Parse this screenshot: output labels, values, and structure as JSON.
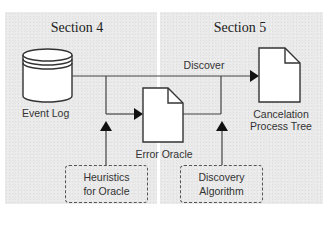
{
  "sections": [
    {
      "title": "Section 4"
    },
    {
      "title": "Section 5"
    }
  ],
  "nodes": {
    "event_log": {
      "label": "Event Log",
      "shape": "database-cylinder"
    },
    "error_oracle": {
      "label": "Error Oracle",
      "shape": "document"
    },
    "cancelation_tree": {
      "label_line1": "Cancelation",
      "label_line2": "Process Tree",
      "shape": "document"
    },
    "heuristics": {
      "label_line1": "Heuristics",
      "label_line2": "for Oracle",
      "shape": "dashed-box"
    },
    "discovery_algorithm": {
      "label_line1": "Discovery",
      "label_line2": "Algorithm",
      "shape": "dashed-box"
    }
  },
  "edges": [
    {
      "from": "Event Log",
      "to": "Cancelation Process Tree",
      "label": "Discover"
    },
    {
      "from": "Event Log",
      "to": "Error Oracle",
      "label": ""
    },
    {
      "from": "Error Oracle",
      "to": "Discover edge",
      "label": ""
    },
    {
      "from": "Heuristics for Oracle",
      "to": "Event Log → Error Oracle edge",
      "label": ""
    },
    {
      "from": "Discovery Algorithm",
      "to": "Error Oracle → Discover edge",
      "label": ""
    }
  ],
  "edge_labels": {
    "discover": "Discover"
  },
  "colors": {
    "panel_bg": "#e9e9e9",
    "stroke": "#333333",
    "shape_fill": "#ffffff"
  }
}
